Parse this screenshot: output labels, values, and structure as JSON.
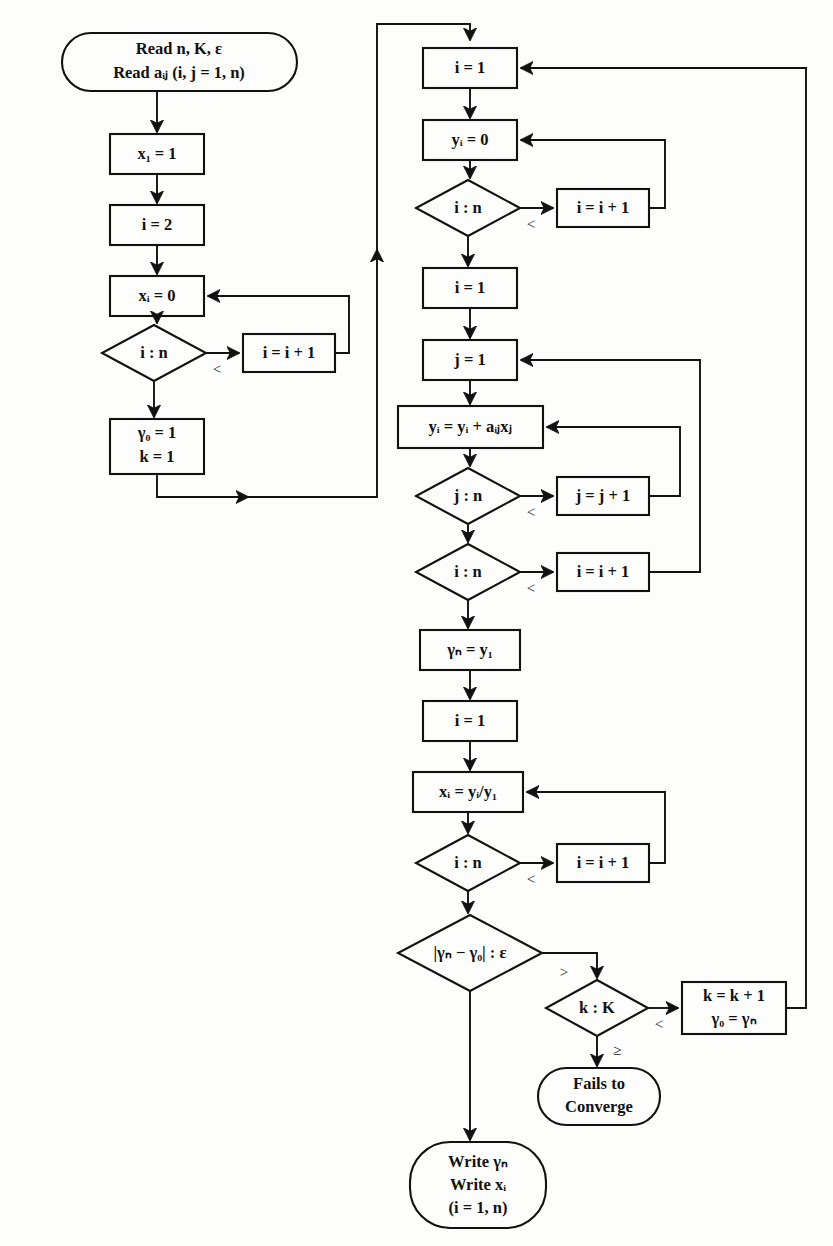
{
  "diagram": {
    "background_color": "#fdfdfb",
    "line_color": "#111111",
    "nodes": {
      "read_input": {
        "shape": "terminal",
        "line1": "Read n, K, ε",
        "line2": "Read aᵢⱼ  (i, j = 1, n)"
      },
      "x1_init": {
        "shape": "process",
        "text": "x₁ = 1"
      },
      "i_eq_2": {
        "shape": "process",
        "text": "i = 2"
      },
      "xi_zero": {
        "shape": "process",
        "text": "xᵢ = 0"
      },
      "cmp_in_1": {
        "shape": "decision",
        "text": "i : n"
      },
      "inc_i_1": {
        "shape": "process",
        "text": "i = i + 1"
      },
      "gamma_k_init": {
        "shape": "process",
        "line1": "γ₀ = 1",
        "line2": "k = 1"
      },
      "i_eq_1_a": {
        "shape": "process",
        "text": "i = 1"
      },
      "yi_zero": {
        "shape": "process",
        "text": "yᵢ = 0"
      },
      "cmp_in_2": {
        "shape": "decision",
        "text": "i : n"
      },
      "inc_i_2": {
        "shape": "process",
        "text": "i = i + 1"
      },
      "i_eq_1_b": {
        "shape": "process",
        "text": "i = 1"
      },
      "j_eq_1": {
        "shape": "process",
        "text": "j = 1"
      },
      "accumulate": {
        "shape": "process",
        "text": "yᵢ = yᵢ + aᵢⱼxⱼ"
      },
      "cmp_jn": {
        "shape": "decision",
        "text": "j : n"
      },
      "inc_j": {
        "shape": "process",
        "text": "j = j + 1"
      },
      "cmp_in_3": {
        "shape": "decision",
        "text": "i : n"
      },
      "inc_i_3": {
        "shape": "process",
        "text": "i = i + 1"
      },
      "gamma_n": {
        "shape": "process",
        "text": "γₙ = y₁"
      },
      "i_eq_1_c": {
        "shape": "process",
        "text": "i = 1"
      },
      "normalize": {
        "shape": "process",
        "text": "xᵢ = yᵢ/y₁"
      },
      "cmp_in_4": {
        "shape": "decision",
        "text": "i : n"
      },
      "inc_i_4": {
        "shape": "process",
        "text": "i = i + 1"
      },
      "cmp_converge": {
        "shape": "decision",
        "text": "|γₙ − γ₀| : ε"
      },
      "cmp_kK": {
        "shape": "decision",
        "text": "k : K"
      },
      "k_update": {
        "shape": "process",
        "line1": "k = k + 1",
        "line2": "γ₀ = γₙ"
      },
      "fails": {
        "shape": "terminal",
        "line1": "Fails to",
        "line2": "Converge"
      },
      "write_out": {
        "shape": "terminal",
        "line1": "Write γₙ",
        "line2": "Write xᵢ",
        "line3": "(i = 1, n)"
      }
    },
    "branch_labels": {
      "lt_1": "<",
      "lt_2": "<",
      "lt_3": "<",
      "lt_4": "<",
      "lt_5": "<",
      "lt_6": "<",
      "gt_converge": ">",
      "ge_kK": "≥"
    }
  }
}
